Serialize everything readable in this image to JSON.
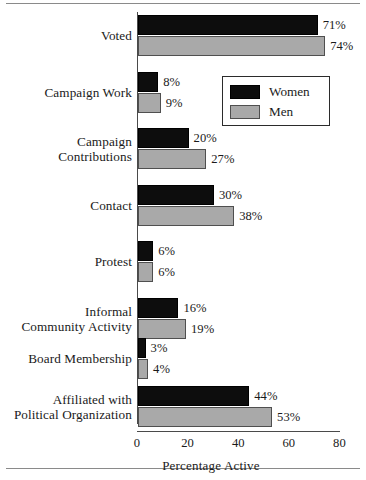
{
  "figure": {
    "name": "political-participation-by-gender-bar-chart"
  },
  "chart_data": {
    "type": "bar",
    "orientation": "horizontal",
    "title": "",
    "xlabel": "Percentage Active",
    "ylabel": "",
    "xlim": [
      0,
      80
    ],
    "xticks": [
      0,
      20,
      40,
      60,
      80
    ],
    "xtick_labels": [
      "0",
      "20",
      "40",
      "60",
      "80"
    ],
    "grid": false,
    "legend_position": "upper-right-inside",
    "categories": [
      "Voted",
      "Campaign Work",
      "Campaign\nContributions",
      "Contact",
      "Protest",
      "Informal\nCommunity Activity",
      "Board Membership",
      "Affiliated with\nPolitical Organization"
    ],
    "series": [
      {
        "name": "Women",
        "color": "#0d0d0d",
        "values": [
          71,
          8,
          20,
          30,
          6,
          16,
          3,
          44
        ],
        "labels": [
          "71%",
          "8%",
          "20%",
          "30%",
          "6%",
          "16%",
          "3%",
          "44%"
        ]
      },
      {
        "name": "Men",
        "color": "#a9a9a9",
        "values": [
          74,
          9,
          27,
          38,
          6,
          19,
          4,
          53
        ],
        "labels": [
          "74%",
          "9%",
          "27%",
          "38%",
          "6%",
          "19%",
          "4%",
          "53%"
        ]
      }
    ]
  },
  "legend": {
    "entries": [
      {
        "label": "Women",
        "swatch": "women"
      },
      {
        "label": "Men",
        "swatch": "men"
      }
    ]
  }
}
